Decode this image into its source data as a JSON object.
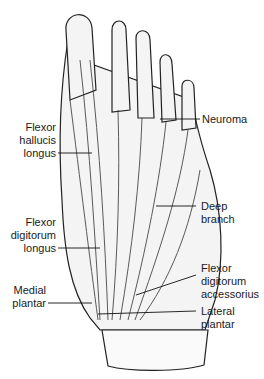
{
  "figure": {
    "labels": [
      {
        "id": "flexor-hallucis-longus",
        "text": "Flexor\nhallucis\nlongus",
        "side": "left"
      },
      {
        "id": "flexor-digitorum-longus",
        "text": "Flexor\ndigitorum\nlongus",
        "side": "left"
      },
      {
        "id": "medial-plantar",
        "text": "Medial\nplantar",
        "side": "left"
      },
      {
        "id": "neuroma",
        "text": "Neuroma",
        "side": "right"
      },
      {
        "id": "deep-branch",
        "text": "Deep\nbranch",
        "side": "right"
      },
      {
        "id": "flexor-digitorum-accessorius",
        "text": "Flexor\ndigitorum\naccessorius",
        "side": "right"
      },
      {
        "id": "lateral-plantar",
        "text": "Lateral\nplantar",
        "side": "right"
      }
    ]
  }
}
